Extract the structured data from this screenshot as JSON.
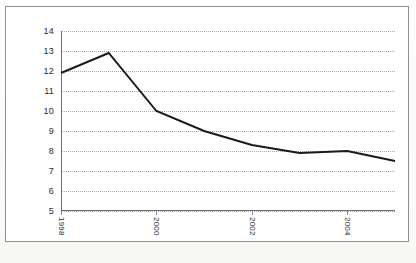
{
  "figure": {
    "background_color": "#fdfdfc",
    "frame_border_color": "#8e8e8e",
    "plot_background_color": "#ffffff"
  },
  "chart_data": {
    "type": "line",
    "title": "",
    "subtitle": "",
    "xlabel": "",
    "ylabel": "",
    "x": [
      1998,
      1999,
      2000,
      2001,
      2002,
      2003,
      2004,
      2005
    ],
    "values": [
      11.9,
      12.9,
      10.0,
      9.0,
      8.3,
      7.9,
      8.0,
      7.5
    ],
    "series": [
      {
        "name": "",
        "values": [
          11.9,
          12.9,
          10.0,
          9.0,
          8.3,
          7.9,
          8.0,
          7.5
        ],
        "color": "#1a1a1a",
        "line_width": 1.9,
        "markers": "none"
      }
    ],
    "xlim": [
      1998,
      2005
    ],
    "ylim": [
      5,
      14
    ],
    "yticks": [
      5,
      6,
      7,
      8,
      9,
      10,
      11,
      12,
      13,
      14
    ],
    "ytick_labels": [
      "5",
      "6",
      "7",
      "8",
      "9",
      "10",
      "11",
      "12",
      "13",
      "14"
    ],
    "xticks": [
      1998,
      2000,
      2002,
      2004
    ],
    "xtick_labels": [
      "1998",
      "2000",
      "2002",
      "2004"
    ],
    "xtick_label_rotation": 90,
    "grid": {
      "horizontal": true,
      "vertical": false,
      "style": "dotted",
      "color": "#a9a9a9"
    },
    "legend": {
      "visible": false,
      "position": "none",
      "entries": []
    },
    "annotations": []
  },
  "axes": {
    "axis_line_color": "#6f6f6f",
    "tick_color": "#8a8a8a",
    "tick_label_color": "#2b2b2b"
  }
}
